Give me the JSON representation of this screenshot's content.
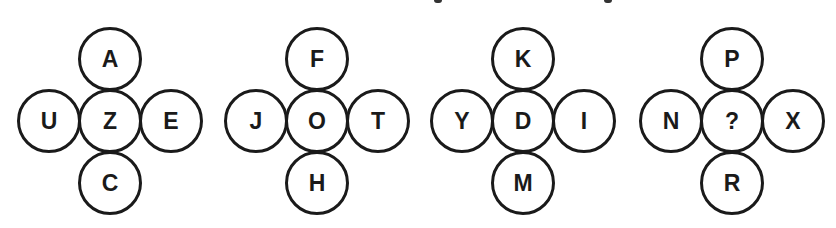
{
  "title_fragment": {
    "note": "cropped text descenders at top edge",
    "marks": [
      {
        "x": 434,
        "width": 8
      },
      {
        "x": 604,
        "width": 8
      }
    ]
  },
  "layout": {
    "stroke_color": "#1a1a1a",
    "row_y": [
      59,
      121,
      183
    ],
    "arm_offset_x": 61
  },
  "puzzles": [
    {
      "id": "cross-1",
      "center_x": 110,
      "top": "A",
      "left": "U",
      "center": "Z",
      "right": "E",
      "bottom": "C"
    },
    {
      "id": "cross-2",
      "center_x": 317,
      "top": "F",
      "left": "J",
      "center": "O",
      "right": "T",
      "bottom": "H"
    },
    {
      "id": "cross-3",
      "center_x": 523,
      "top": "K",
      "left": "Y",
      "center": "D",
      "right": "I",
      "bottom": "M"
    },
    {
      "id": "cross-4",
      "center_x": 732,
      "top": "P",
      "left": "N",
      "center": "?",
      "right": "X",
      "bottom": "R"
    }
  ]
}
